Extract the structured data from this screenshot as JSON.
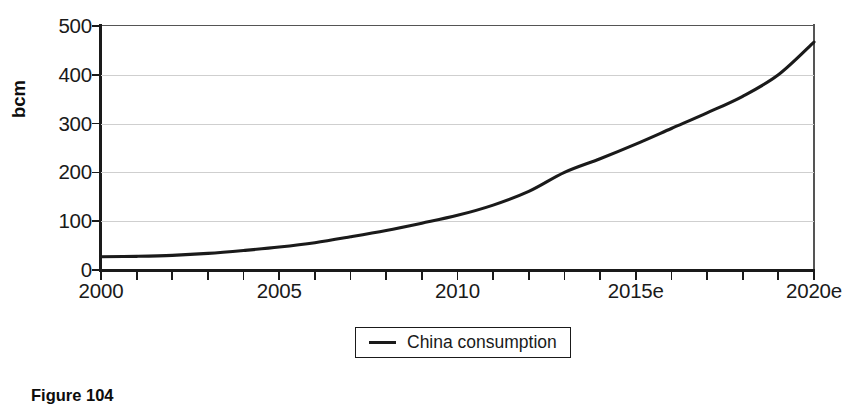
{
  "chart_data": {
    "type": "line",
    "title": "",
    "xlabel": "",
    "ylabel": "bcm",
    "xlim": [
      2000,
      2020
    ],
    "ylim": [
      0,
      500
    ],
    "yticks": [
      0,
      100,
      200,
      300,
      400,
      500
    ],
    "ytick_labels": [
      "0",
      "100",
      "200",
      "300",
      "400",
      "500"
    ],
    "xtick_positions": [
      2000,
      2005,
      2010,
      2015,
      2020
    ],
    "xtick_labels": [
      "2000",
      "2005",
      "2010",
      "2015e",
      "2020e"
    ],
    "grid": "horizontal",
    "legend_position": "below-center",
    "series": [
      {
        "name": "China consumption",
        "color": "#1a1a1a",
        "x": [
          2000,
          2001,
          2002,
          2003,
          2004,
          2005,
          2006,
          2007,
          2008,
          2009,
          2010,
          2011,
          2012,
          2013,
          2014,
          2015,
          2016,
          2017,
          2018,
          2019,
          2020
        ],
        "values": [
          27,
          28,
          30,
          34,
          40,
          47,
          56,
          68,
          81,
          96,
          112,
          133,
          161,
          200,
          228,
          258,
          290,
          322,
          356,
          400,
          467
        ]
      }
    ]
  },
  "legend": {
    "entry_label": "China consumption"
  },
  "axis": {
    "y_title": "bcm"
  },
  "caption": {
    "text": "Figure 104"
  }
}
